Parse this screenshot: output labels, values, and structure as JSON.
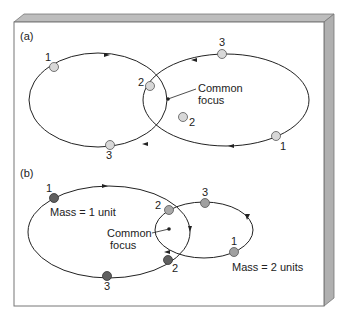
{
  "panels": [
    {
      "id": "a",
      "label": "(a)",
      "focus_label_line1": "Common",
      "focus_label_line2": "focus",
      "points": {
        "left_1": "1",
        "left_2": "2",
        "left_3": "3",
        "right_1": "1",
        "right_2": "2",
        "right_3": "3"
      }
    },
    {
      "id": "b",
      "label": "(b)",
      "focus_label_line1": "Common",
      "focus_label_line2": "focus",
      "mass_small_label": "Mass = 1 unit",
      "mass_large_label": "Mass = 2 units",
      "points": {
        "m1_1": "1",
        "m1_2": "2",
        "m1_3": "3",
        "m2_1": "1",
        "m2_2": "2",
        "m2_3": "3"
      }
    }
  ],
  "colors": {
    "frame_face": "#ffffff",
    "frame_bevel": "#b8b8b8",
    "frame_edge": "#777777",
    "orbit": "#222222",
    "body_light": "#d8d8d8",
    "body_mid": "#a0a0a0",
    "body_dark": "#606060"
  }
}
